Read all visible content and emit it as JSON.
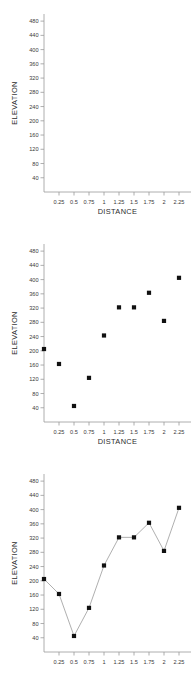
{
  "figure": {
    "background_color": "#ffffff",
    "marker_color": "#111111",
    "line_color": "#8d8d8d",
    "axis_color": "#9a9a9a",
    "panel_count": 3
  },
  "chart_data": [
    {
      "type": "scatter",
      "panel": "top",
      "title": "",
      "xlabel": "DISTANCE",
      "ylabel": "ELEVATION",
      "xlim": [
        0,
        2.45
      ],
      "ylim": [
        0,
        500
      ],
      "xticks": [
        0.25,
        0.5,
        0.75,
        1,
        1.25,
        1.5,
        1.75,
        2,
        2.25
      ],
      "xtick_labels": [
        "0.25",
        "0.5",
        "0.75",
        "1",
        "1.25",
        "1.5",
        "1.75",
        "2",
        "2.25"
      ],
      "yticks": [
        40,
        80,
        120,
        160,
        200,
        240,
        280,
        320,
        360,
        400,
        440,
        480
      ],
      "ytick_labels": [
        "40",
        "80",
        "120",
        "160",
        "200",
        "240",
        "280",
        "320",
        "360",
        "400",
        "440",
        "480"
      ],
      "grid": false,
      "legend": "none",
      "x": [],
      "values": [],
      "note": "empty plot frame, no data plotted"
    },
    {
      "type": "scatter",
      "panel": "middle",
      "title": "",
      "xlabel": "DISTANCE",
      "ylabel": "ELEVATION",
      "xlim": [
        0,
        2.45
      ],
      "ylim": [
        0,
        500
      ],
      "xticks": [
        0.25,
        0.5,
        0.75,
        1,
        1.25,
        1.5,
        1.75,
        2,
        2.25
      ],
      "xtick_labels": [
        "0.25",
        "0.5",
        "0.75",
        "1",
        "1.25",
        "1.5",
        "1.75",
        "2",
        "2.25"
      ],
      "yticks": [
        40,
        80,
        120,
        160,
        200,
        240,
        280,
        320,
        360,
        400,
        440,
        480
      ],
      "ytick_labels": [
        "40",
        "80",
        "120",
        "160",
        "200",
        "240",
        "280",
        "320",
        "360",
        "400",
        "440",
        "480"
      ],
      "grid": false,
      "legend": "none",
      "x": [
        0,
        0.25,
        0.5,
        0.75,
        1,
        1.25,
        1.5,
        1.75,
        2,
        2.25
      ],
      "values": [
        205,
        163,
        45,
        124,
        243,
        322,
        322,
        363,
        284,
        405
      ]
    },
    {
      "type": "line",
      "panel": "bottom",
      "title": "",
      "xlabel": "",
      "ylabel": "ELEVATION",
      "xlim": [
        0,
        2.45
      ],
      "ylim": [
        0,
        500
      ],
      "xticks": [
        0.25,
        0.5,
        0.75,
        1,
        1.25,
        1.5,
        1.75,
        2,
        2.25
      ],
      "xtick_labels": [
        "0.25",
        "0.5",
        "0.75",
        "1",
        "1.25",
        "1.5",
        "1.75",
        "2",
        "2.25"
      ],
      "yticks": [
        40,
        80,
        120,
        160,
        200,
        240,
        280,
        320,
        360,
        400,
        440,
        480
      ],
      "ytick_labels": [
        "40",
        "80",
        "120",
        "160",
        "200",
        "240",
        "280",
        "320",
        "360",
        "400",
        "440",
        "480"
      ],
      "grid": false,
      "legend": "none",
      "markers": true,
      "x": [
        0,
        0.25,
        0.5,
        0.75,
        1,
        1.25,
        1.5,
        1.75,
        2,
        2.25
      ],
      "values": [
        205,
        163,
        45,
        124,
        243,
        322,
        322,
        363,
        284,
        405
      ],
      "note": "bottom of panel cropped; x axis title not visible"
    }
  ]
}
